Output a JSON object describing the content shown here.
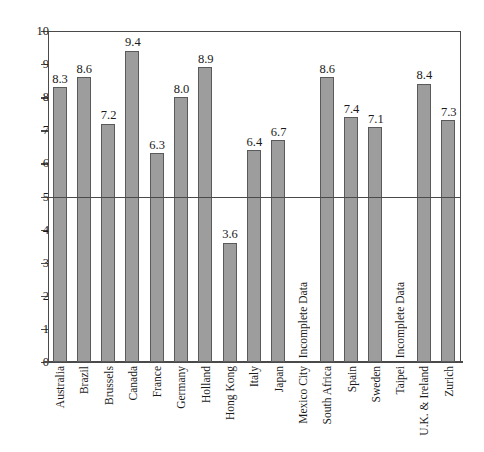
{
  "chart_data": {
    "type": "bar",
    "title": "",
    "xlabel": "",
    "ylabel": "",
    "ylim": [
      0,
      10
    ],
    "ytick_labels": [
      "10",
      "9",
      "8",
      "7",
      "6",
      "5",
      "4",
      "3",
      "2",
      "1",
      "0"
    ],
    "yticks": [
      10,
      9,
      8,
      7,
      6,
      5,
      4,
      3,
      2,
      1,
      0
    ],
    "grid": false,
    "legend": "none",
    "reference_line": 5,
    "categories": [
      "Australia",
      "Brazil",
      "Brussels",
      "Canada",
      "France",
      "Germany",
      "Holland",
      "Hong Kong",
      "Italy",
      "Japan",
      "Mexico City",
      "South Africa",
      "Spain",
      "Sweden",
      "Taipei",
      "U.K. & Ireland",
      "Zurich"
    ],
    "values": [
      8.3,
      8.6,
      7.2,
      9.4,
      6.3,
      8.0,
      8.9,
      3.6,
      6.4,
      6.7,
      null,
      8.6,
      7.4,
      7.1,
      null,
      8.4,
      7.3
    ],
    "value_labels": [
      "8.3",
      "8.6",
      "7.2",
      "9.4",
      "6.3",
      "8.0",
      "8.9",
      "3.6",
      "6.4",
      "6.7",
      "",
      "8.6",
      "7.4",
      "7.1",
      "",
      "8.4",
      "7.3"
    ],
    "missing_label": "Incomplete Data",
    "missing_indices": [
      10,
      14
    ],
    "colors": {
      "bar_fill": "#9d9d9d",
      "bar_stroke": "#5a5a5a",
      "axis": "#4a4a4a",
      "text": "#1a1a1a",
      "background": "#ffffff"
    }
  }
}
